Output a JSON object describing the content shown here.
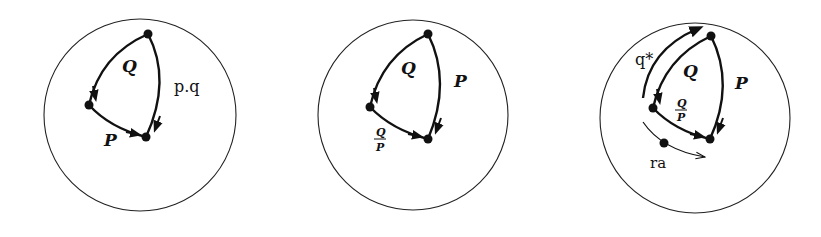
{
  "panels": [
    {
      "id": "panel-1",
      "labels": {
        "left_edge": "Q",
        "right_edge": "p.q",
        "bottom_edge": "P"
      }
    },
    {
      "id": "panel-2",
      "labels": {
        "left_edge": "Q",
        "right_edge": "P",
        "bottom_num": "Q",
        "bottom_den": "P"
      }
    },
    {
      "id": "panel-3",
      "labels": {
        "left_edge": "Q",
        "right_edge": "P",
        "bottom_num": "Q",
        "bottom_den": "P",
        "outer_arrow": "q*",
        "moving_point": "ra"
      }
    }
  ],
  "colors": {
    "stroke": "#111111",
    "background": "#ffffff"
  }
}
